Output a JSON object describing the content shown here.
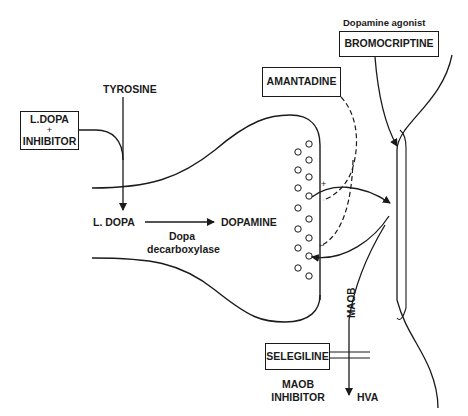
{
  "diagram": {
    "boxes": {
      "ldopa_inhibitor": {
        "line1": "L.DOPA",
        "line2": "+",
        "line3": "INHIBITOR"
      },
      "amantadine": {
        "label": "AMANTADINE"
      },
      "bromocriptine": {
        "label": "BROMOCRIPTINE",
        "caption": "Dopamine agonist"
      },
      "selegiline": {
        "label": "SELEGILINE",
        "caption_line1": "MAOB",
        "caption_line2": "INHIBITOR"
      }
    },
    "labels": {
      "tyrosine": "TYROSINE",
      "ldopa": "L. DOPA",
      "dopamine": "DOPAMINE",
      "enzyme_line1": "Dopa",
      "enzyme_line2": "decarboxylase",
      "maob": "MAOB",
      "hva": "HVA",
      "plus_sign": "+",
      "minus_sign": "−"
    },
    "vesicles": [
      [
        309,
        144
      ],
      [
        298,
        152
      ],
      [
        309,
        160
      ],
      [
        298,
        170
      ],
      [
        309,
        177
      ],
      [
        298,
        188
      ],
      [
        309,
        196
      ],
      [
        298,
        208
      ],
      [
        309,
        219
      ],
      [
        298,
        229
      ],
      [
        309,
        238
      ],
      [
        298,
        248
      ],
      [
        309,
        256
      ],
      [
        298,
        268
      ],
      [
        309,
        276
      ]
    ],
    "colors": {
      "ink": "#1a1a1a",
      "background": "#ffffff"
    }
  }
}
